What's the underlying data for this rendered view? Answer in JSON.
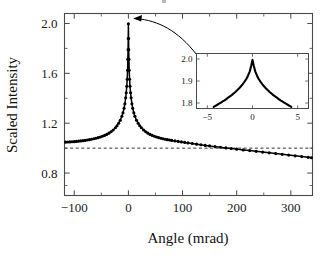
{
  "figure": {
    "kind": "scientific-plot",
    "background_color": "#ffffff",
    "foreground_color": "#000000",
    "axis_color": "#4a4a4a"
  },
  "main_axes": {
    "xlabel": "Angle (mrad)",
    "ylabel": "Scaled Intensity",
    "x_ticklabels": [
      "-100",
      "0",
      "100",
      "200",
      "300"
    ],
    "x_tickvalues": [
      -100,
      0,
      100,
      200,
      300
    ],
    "y_ticklabels": [
      "2.0",
      "1.6",
      "1.2",
      "0.8"
    ],
    "y_tickvalues": [
      2.0,
      1.6,
      1.2,
      0.8
    ],
    "xlim": [
      -118,
      340
    ],
    "ylim": [
      0.62,
      2.08
    ],
    "x_minor_count": 1,
    "y_minor_count": 1,
    "grid": false,
    "frame": "box"
  },
  "inset_axes": {
    "x_ticklabels": [
      "-5",
      "0",
      "5"
    ],
    "x_tickvalues": [
      -5,
      0,
      5
    ],
    "y_ticklabels": [
      "2.0",
      "1.9",
      "1.8"
    ],
    "y_tickvalues": [
      2.0,
      1.9,
      1.8
    ],
    "xlim": [
      -6.2,
      6.2
    ],
    "ylim": [
      1.775,
      2.025
    ],
    "grid": false,
    "frame": "box"
  },
  "annotations": {
    "leader": {
      "name": "inset-callout-leader",
      "from_label": "inset-top-left",
      "to_label": "main-peak-apex",
      "arrow": true
    },
    "baseline": {
      "name": "unit-baseline",
      "value": 1.0,
      "style": "dashed"
    }
  },
  "chart_data": {
    "type": "line",
    "title": "",
    "xlabel": "Angle (mrad)",
    "ylabel": "Scaled Intensity",
    "xlim": [
      -118,
      340
    ],
    "ylim": [
      0.62,
      2.08
    ],
    "xticks": [
      -100,
      0,
      100,
      200,
      300
    ],
    "yticks": [
      0.8,
      1.2,
      1.6,
      2.0
    ],
    "grid": false,
    "legend": "none",
    "series": [
      {
        "name": "Scaled intensity (rocking curve)",
        "marker": "filled-circle",
        "line": "solid",
        "color": "#000000",
        "x": [
          -116,
          -112,
          -108,
          -104,
          -100,
          -96,
          -92,
          -88,
          -84,
          -80,
          -76,
          -72,
          -68,
          -64,
          -60,
          -56,
          -52,
          -48,
          -44,
          -40,
          -36,
          -32,
          -28,
          -24,
          -21,
          -18,
          -15,
          -12,
          -10,
          -8,
          -6.5,
          -5,
          -4,
          -3,
          -2.2,
          -1.5,
          -1,
          -0.6,
          -0.3,
          0,
          0.3,
          0.6,
          1,
          1.5,
          2.2,
          3,
          4,
          5,
          6.5,
          8,
          10,
          12,
          15,
          18,
          21,
          24,
          28,
          32,
          36,
          40,
          44,
          48,
          52,
          56,
          60,
          64,
          68,
          72,
          76,
          80,
          86,
          92,
          98,
          104,
          110,
          118,
          126,
          134,
          142,
          150,
          160,
          170,
          180,
          190,
          200,
          212,
          224,
          236,
          248,
          260,
          272,
          284,
          296,
          308,
          320,
          332,
          338
        ],
        "y": [
          1.048,
          1.049,
          1.05,
          1.051,
          1.052,
          1.054,
          1.056,
          1.058,
          1.06,
          1.062,
          1.065,
          1.068,
          1.071,
          1.075,
          1.079,
          1.084,
          1.089,
          1.095,
          1.102,
          1.11,
          1.12,
          1.132,
          1.146,
          1.164,
          1.18,
          1.2,
          1.224,
          1.256,
          1.284,
          1.32,
          1.356,
          1.404,
          1.444,
          1.496,
          1.552,
          1.624,
          1.712,
          1.79,
          1.88,
          1.998,
          1.88,
          1.79,
          1.712,
          1.624,
          1.552,
          1.496,
          1.444,
          1.404,
          1.356,
          1.32,
          1.284,
          1.256,
          1.224,
          1.2,
          1.18,
          1.164,
          1.146,
          1.132,
          1.12,
          1.11,
          1.102,
          1.095,
          1.089,
          1.084,
          1.079,
          1.075,
          1.071,
          1.068,
          1.065,
          1.062,
          1.058,
          1.054,
          1.05,
          1.046,
          1.042,
          1.037,
          1.032,
          1.027,
          1.022,
          1.018,
          1.012,
          1.007,
          1.002,
          0.997,
          0.992,
          0.986,
          0.98,
          0.974,
          0.968,
          0.962,
          0.956,
          0.95,
          0.944,
          0.938,
          0.932,
          0.926,
          0.923
        ]
      },
      {
        "name": "Unit baseline",
        "marker": "none",
        "line": "dashed",
        "color": "#333333",
        "x": [
          -118,
          340
        ],
        "y": [
          1.0,
          1.0
        ]
      }
    ]
  },
  "inset_chart_data": {
    "type": "line",
    "title": "",
    "xlabel": "",
    "ylabel": "",
    "xlim": [
      -6.2,
      6.2
    ],
    "ylim": [
      1.775,
      2.025
    ],
    "xticks": [
      -5,
      0,
      5
    ],
    "yticks": [
      1.8,
      1.9,
      2.0
    ],
    "grid": false,
    "legend": "none",
    "series": [
      {
        "name": "Peak detail",
        "marker": "filled-circle",
        "line": "solid",
        "color": "#000000",
        "x": [
          -4.3,
          -4.1,
          -3.9,
          -3.7,
          -3.5,
          -3.3,
          -3.1,
          -2.9,
          -2.7,
          -2.5,
          -2.3,
          -2.1,
          -1.9,
          -1.7,
          -1.5,
          -1.3,
          -1.1,
          -0.9,
          -0.7,
          -0.5,
          -0.3,
          -0.15,
          0,
          0.15,
          0.3,
          0.5,
          0.7,
          0.9,
          1.1,
          1.3,
          1.5,
          1.7,
          1.9,
          2.1,
          2.3,
          2.5,
          2.7,
          2.9,
          3.1,
          3.3,
          3.5,
          3.7,
          3.9,
          4.1,
          4.3
        ],
        "y": [
          1.782,
          1.787,
          1.792,
          1.797,
          1.802,
          1.807,
          1.812,
          1.818,
          1.824,
          1.83,
          1.836,
          1.843,
          1.85,
          1.858,
          1.866,
          1.875,
          1.885,
          1.896,
          1.908,
          1.924,
          1.944,
          1.968,
          1.996,
          1.968,
          1.944,
          1.924,
          1.908,
          1.896,
          1.885,
          1.875,
          1.866,
          1.858,
          1.85,
          1.843,
          1.836,
          1.83,
          1.824,
          1.818,
          1.812,
          1.807,
          1.802,
          1.797,
          1.792,
          1.787,
          1.782
        ]
      }
    ]
  }
}
